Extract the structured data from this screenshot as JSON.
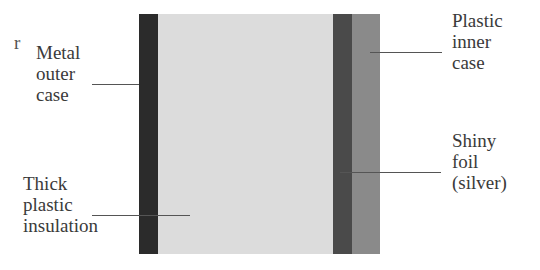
{
  "diagram": {
    "layers": [
      {
        "name": "metal-outer-case",
        "label": "Metal outer case",
        "color": "#2b2b2b",
        "x": 139,
        "width": 19
      },
      {
        "name": "thick-plastic-insulation",
        "label": "Thick plastic insulation",
        "color": "#dcdcdc",
        "x": 158,
        "width": 175
      },
      {
        "name": "shiny-foil",
        "label": "Shiny foil (silver)",
        "color": "#4a4a4a",
        "x": 333,
        "width": 19
      },
      {
        "name": "plastic-inner-case",
        "label": "Plastic inner case",
        "color": "#8a8a8a",
        "x": 352,
        "width": 28
      }
    ],
    "labels": {
      "metal_outer_case": "Metal\nouter\ncase",
      "thick_plastic_insulation": "Thick\nplastic\ninsulation",
      "plastic_inner_case": "Plastic\ninner\ncase",
      "shiny_foil": "Shiny\nfoil\n(silver)"
    },
    "fragment_left": "r"
  }
}
